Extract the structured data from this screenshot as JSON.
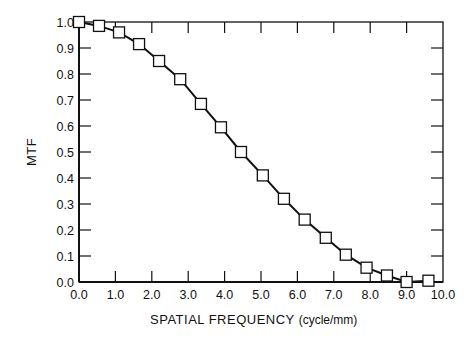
{
  "chart_data": {
    "type": "line",
    "title": "",
    "xlabel": "SPATIAL FREQUENCY",
    "xlabel_unit": "(cycle/mm)",
    "ylabel": "MTF",
    "xlim": [
      0.0,
      10.0
    ],
    "ylim": [
      0.0,
      1.0
    ],
    "grid": false,
    "legend": null,
    "marker": "open-square",
    "x_ticks": [
      "0.0",
      "1.0",
      "2.0",
      "3.0",
      "4.0",
      "5.0",
      "6.0",
      "7.0",
      "8.0",
      "9.0",
      "10.0"
    ],
    "y_ticks": [
      "0.0",
      "0.1",
      "0.2",
      "0.3",
      "0.4",
      "0.5",
      "0.6",
      "0.7",
      "0.8",
      "0.9",
      "1.0"
    ],
    "series": [
      {
        "name": "MTF",
        "x": [
          0.0,
          0.55,
          1.1,
          1.65,
          2.2,
          2.78,
          3.35,
          3.9,
          4.45,
          5.05,
          5.63,
          6.2,
          6.78,
          7.33,
          7.9,
          8.46,
          9.0,
          9.6
        ],
        "y": [
          1.0,
          0.985,
          0.96,
          0.915,
          0.85,
          0.78,
          0.685,
          0.595,
          0.5,
          0.41,
          0.32,
          0.24,
          0.17,
          0.105,
          0.055,
          0.025,
          0.0,
          0.005
        ]
      }
    ]
  }
}
